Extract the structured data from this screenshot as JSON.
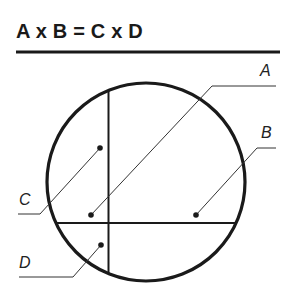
{
  "title": "A x B = C x D",
  "labels": {
    "a": "A",
    "b": "B",
    "c": "C",
    "d": "D"
  },
  "colors": {
    "stroke": "#1a1a1a",
    "thin_stroke": "#333333",
    "background": "#ffffff"
  }
}
